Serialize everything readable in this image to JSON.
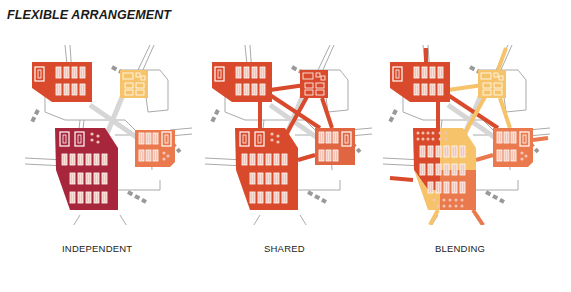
{
  "title": "FLEXIBLE ARRANGEMENT",
  "colors": {
    "red_orange": "#d84a2b",
    "crimson": "#a8263c",
    "yellow": "#f6c36a",
    "salmon": "#ea7a4e",
    "road": "#c8c8c8",
    "road_outline": "#9a9a9a",
    "bus_stop": "#9a9a9a",
    "unit_fill": "#f7c9b6"
  },
  "panels": [
    {
      "id": "independent",
      "label": "INDEPENDENT"
    },
    {
      "id": "shared",
      "label": "SHARED"
    },
    {
      "id": "blending",
      "label": "BLENDING"
    }
  ]
}
